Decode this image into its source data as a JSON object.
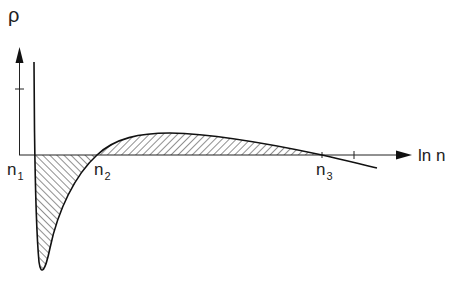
{
  "diagram": {
    "y_axis_label": "ρ",
    "x_axis_label": "ln n",
    "points": [
      {
        "name": "n",
        "sub": "1"
      },
      {
        "name": "n",
        "sub": "2"
      },
      {
        "name": "n",
        "sub": "3"
      }
    ],
    "colors": {
      "line": "#1a1a1a",
      "background": "#ffffff"
    }
  }
}
